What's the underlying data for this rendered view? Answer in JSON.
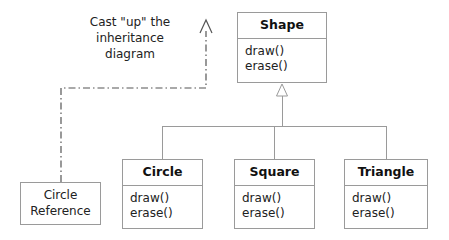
{
  "diagram": {
    "type": "uml-class-diagram"
  },
  "note": {
    "line1": "Cast \"up\" the",
    "line2": "inheritance",
    "line3": "diagram"
  },
  "classes": {
    "shape": {
      "name": "Shape",
      "operations": [
        "draw()",
        "erase()"
      ]
    },
    "circle": {
      "name": "Circle",
      "operations": [
        "draw()",
        "erase()"
      ]
    },
    "square": {
      "name": "Square",
      "operations": [
        "draw()",
        "erase()"
      ]
    },
    "triangle": {
      "name": "Triangle",
      "operations": [
        "draw()",
        "erase()"
      ]
    }
  },
  "reference_box": {
    "line1": "Circle",
    "line2": "Reference"
  },
  "colors": {
    "box_border": "#9a9a9a",
    "connector": "#9a9a9a",
    "cast_connector": "#555555",
    "text": "#222222",
    "title_text": "#111111",
    "background": "#ffffff"
  },
  "relationships": {
    "generalization_label": "generalization",
    "cast_label": "upcast"
  }
}
